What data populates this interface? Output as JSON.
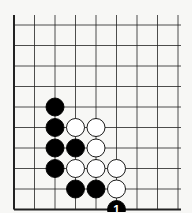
{
  "diagram": {
    "type": "go-board-corner",
    "grid": {
      "columns_visible": 9,
      "rows_visible": 9,
      "origin_x": 14,
      "origin_y": 25,
      "spacing": 20.5,
      "edges": [
        "left",
        "bottom"
      ]
    },
    "colors": {
      "background": "#f7f7f5",
      "line": "#222222",
      "black_stone": "#000000",
      "white_stone": "#ffffff",
      "stone_outline": "#000000",
      "label_on_black": "#ffffff"
    },
    "stones": [
      {
        "color": "black",
        "col": 2,
        "row": 4
      },
      {
        "color": "black",
        "col": 2,
        "row": 5
      },
      {
        "color": "black",
        "col": 2,
        "row": 6
      },
      {
        "color": "black",
        "col": 2,
        "row": 7
      },
      {
        "color": "black",
        "col": 3,
        "row": 6
      },
      {
        "color": "black",
        "col": 3,
        "row": 8
      },
      {
        "color": "black",
        "col": 4,
        "row": 8
      },
      {
        "color": "white",
        "col": 3,
        "row": 5
      },
      {
        "color": "white",
        "col": 4,
        "row": 5
      },
      {
        "color": "white",
        "col": 4,
        "row": 6
      },
      {
        "color": "white",
        "col": 3,
        "row": 7
      },
      {
        "color": "white",
        "col": 4,
        "row": 7
      },
      {
        "color": "white",
        "col": 5,
        "row": 7
      },
      {
        "color": "white",
        "col": 5,
        "row": 8
      },
      {
        "color": "black",
        "col": 5,
        "row": 9,
        "label": "1"
      }
    ]
  }
}
